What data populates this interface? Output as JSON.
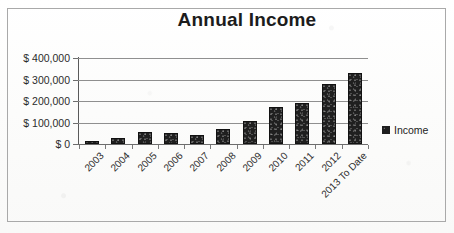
{
  "chart_data": {
    "type": "bar",
    "title": "Annual Income",
    "xlabel": "",
    "ylabel": "",
    "categories": [
      "2003",
      "2004",
      "2005",
      "2006",
      "2007",
      "2008",
      "2009",
      "2010",
      "2011",
      "2012",
      "2013 To Date"
    ],
    "values": [
      15000,
      30000,
      55000,
      53000,
      42000,
      70000,
      105000,
      170000,
      190000,
      278000,
      332000
    ],
    "series": [
      {
        "name": "Income",
        "values": [
          15000,
          30000,
          55000,
          53000,
          42000,
          70000,
          105000,
          170000,
          190000,
          278000,
          332000
        ]
      }
    ],
    "ylim": [
      0,
      400000
    ],
    "ytick_values": [
      0,
      100000,
      200000,
      300000,
      400000
    ],
    "ytick_labels": [
      "$ 0",
      "$ 100,000",
      "$ 200,000",
      "$ 300,000",
      "$ 400,000"
    ],
    "grid": true,
    "legend": {
      "position": "right",
      "entries": [
        {
          "label": "Income",
          "color": "#1f1f1f"
        }
      ]
    },
    "bar_color": "#1f1f1f",
    "gridline_color": "#8f8f8f",
    "axis_color": "#5a5a5a",
    "text_color": "#2b2b2b",
    "background": "#ffffff",
    "border_color": "#a9a9a9"
  }
}
